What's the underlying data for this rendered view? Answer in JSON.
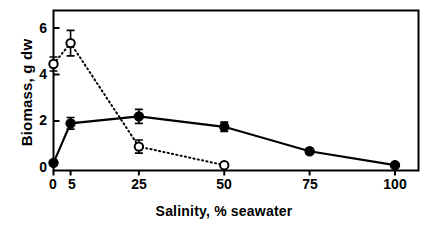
{
  "chart_data": {
    "type": "line",
    "title": "",
    "subtitle": "",
    "xlabel": "Salinity,  % seawater",
    "ylabel": "Biomass,  g dw",
    "x": [
      0,
      5,
      25,
      50,
      75,
      100
    ],
    "xlim": [
      0,
      100
    ],
    "ylim": [
      0,
      6.6
    ],
    "xticks": [
      0,
      5,
      25,
      50,
      75,
      100
    ],
    "xticklabels": [
      "0",
      "5",
      "25",
      "50",
      "75",
      "100"
    ],
    "yticks": [
      0,
      2,
      4,
      6
    ],
    "yticklabels": [
      "0",
      "2",
      "4",
      "6"
    ],
    "grid": false,
    "legend": "none",
    "series": [
      {
        "name": "filled-circle-series",
        "marker": "filled-circle",
        "linestyle": "solid",
        "color": "#000000",
        "x": [
          0,
          5,
          25,
          50,
          75,
          100
        ],
        "values": [
          0.2,
          1.9,
          2.2,
          1.75,
          0.7,
          0.1
        ],
        "errors": [
          0.1,
          0.25,
          0.3,
          0.2,
          0.12,
          0.05
        ]
      },
      {
        "name": "open-circle-series",
        "marker": "open-circle",
        "linestyle": "dotted",
        "color": "#000000",
        "x": [
          0,
          5,
          25,
          50
        ],
        "values": [
          4.45,
          5.35,
          0.9,
          0.1
        ],
        "errors": [
          0.3,
          0.55,
          0.28,
          0.08
        ]
      }
    ],
    "annotations": []
  },
  "axes": {
    "y_tick_0": "0",
    "y_tick_2": "2",
    "y_tick_4": "4",
    "y_tick_6": "6",
    "x_tick_0": "0",
    "x_tick_5": "5",
    "x_tick_25": "25",
    "x_tick_50": "50",
    "x_tick_75": "75",
    "x_tick_100": "100",
    "x_axis_title": "Salinity,  % seawater",
    "y_axis_title": "Biomass,  g dw"
  }
}
